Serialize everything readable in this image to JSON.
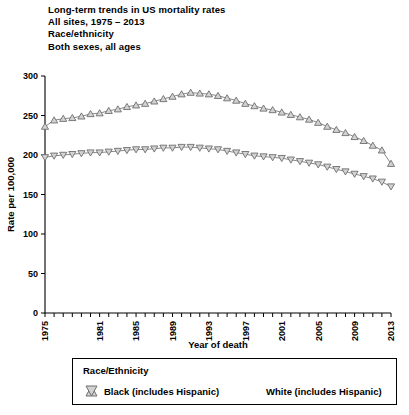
{
  "title": {
    "lines": [
      "Long-term trends in US mortality rates",
      "All sites, 1975 – 2013",
      "Race/ethnicity",
      "Both sexes, all ages"
    ]
  },
  "legend": {
    "title": "Race/Ethnicity",
    "entries": [
      {
        "label": "Black (includes Hispanic)",
        "marker": "triangle-up-icon",
        "fill": "#d2d2d2",
        "stroke": "#6e6e6e"
      },
      {
        "label": "White (includes Hispanic)",
        "marker": "triangle-down-icon",
        "fill": "#d2d2d2",
        "stroke": "#6e6e6e"
      }
    ]
  },
  "chart_data": {
    "type": "line",
    "title": "Long-term trends in US mortality rates",
    "xlabel": "Year of death",
    "ylabel": "Rate per 100,000",
    "xlim": [
      1975,
      2013
    ],
    "ylim": [
      0,
      300
    ],
    "yticks": [
      0,
      50,
      100,
      150,
      200,
      250,
      300
    ],
    "xticks_labeled": [
      1975,
      1981,
      1985,
      1989,
      1993,
      1997,
      2001,
      2005,
      2009,
      2013
    ],
    "xtick_step": 1,
    "grid": false,
    "legend_position": "below-plot",
    "x": [
      1975,
      1976,
      1977,
      1978,
      1979,
      1980,
      1981,
      1982,
      1983,
      1984,
      1985,
      1986,
      1987,
      1988,
      1989,
      1990,
      1991,
      1992,
      1993,
      1994,
      1995,
      1996,
      1997,
      1998,
      1999,
      2000,
      2001,
      2002,
      2003,
      2004,
      2005,
      2006,
      2007,
      2008,
      2009,
      2010,
      2011,
      2012,
      2013
    ],
    "series": [
      {
        "name": "Black (includes Hispanic)",
        "marker": "triangle-up-icon",
        "values": [
          236,
          244,
          246,
          247,
          249,
          252,
          253,
          256,
          258,
          261,
          263,
          265,
          268,
          271,
          274,
          277,
          279,
          278,
          277,
          275,
          272,
          269,
          265,
          262,
          259,
          257,
          254,
          251,
          248,
          245,
          241,
          236,
          232,
          228,
          223,
          218,
          212,
          206,
          189
        ]
      },
      {
        "name": "White (includes Hispanic)",
        "marker": "triangle-down-icon",
        "values": [
          197,
          199,
          200,
          201,
          202,
          203,
          203,
          204,
          205,
          206,
          207,
          207,
          208,
          209,
          209,
          210,
          210,
          209,
          208,
          207,
          205,
          203,
          201,
          199,
          198,
          197,
          196,
          194,
          192,
          190,
          188,
          185,
          182,
          179,
          176,
          173,
          170,
          166,
          160
        ]
      }
    ]
  }
}
